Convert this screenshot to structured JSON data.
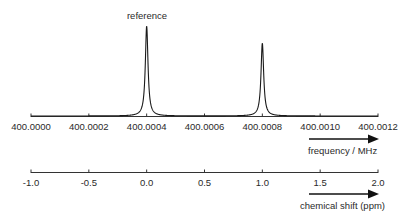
{
  "chart_data": {
    "type": "line",
    "title": "",
    "annotation": "reference",
    "series": [
      {
        "name": "NMR spectrum",
        "peaks": [
          {
            "frequency_MHz": 400.0004,
            "shift_ppm": 0.0,
            "relative_height": 1.0,
            "label": "reference"
          },
          {
            "frequency_MHz": 400.0008,
            "shift_ppm": 1.0,
            "relative_height": 0.81,
            "label": ""
          }
        ]
      }
    ],
    "axes": [
      {
        "name": "frequency",
        "label": "frequency / MHz",
        "range": [
          400.0,
          400.0012
        ],
        "ticks": [
          "400.0000",
          "400.0002",
          "400.0004",
          "400.0006",
          "400.0008",
          "400.0010",
          "400.0012"
        ],
        "direction_arrow": "increasing-right"
      },
      {
        "name": "chemical_shift",
        "label": "chemical shift (ppm)",
        "range": [
          -1.0,
          2.0
        ],
        "ticks": [
          "-1.0",
          "-0.5",
          "0.0",
          "0.5",
          "1.0",
          "1.5",
          "2.0"
        ],
        "direction_arrow": "increasing-right"
      }
    ],
    "grid": false,
    "legend": "none",
    "xlabel": "frequency / MHz",
    "ylabel": ""
  },
  "labels": {
    "reference": "reference",
    "freq_axis_title": "frequency / MHz",
    "ppm_axis_title": "chemical shift (ppm)",
    "freq_ticks": [
      "400.0000",
      "400.0002",
      "400.0004",
      "400.0006",
      "400.0008",
      "400.0010",
      "400.0012"
    ],
    "ppm_ticks": [
      "-1.0",
      "-0.5",
      "0.0",
      "0.5",
      "1.0",
      "1.5",
      "2.0"
    ]
  },
  "colors": {
    "line": "#1a1a1a",
    "axis": "#333333",
    "text": "#2a2a2a"
  }
}
